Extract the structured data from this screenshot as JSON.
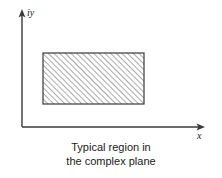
{
  "figure": {
    "background_color": "#ffffff",
    "line_color": "#3a3a3a",
    "hatch_color": "#555555",
    "width": 222,
    "height": 178
  },
  "axes": {
    "y_axis": {
      "label": "iy",
      "name": "imaginary-axis",
      "x": 22,
      "y_top": 12,
      "y_bottom": 127,
      "arrow": "up"
    },
    "x_axis": {
      "label": "x",
      "name": "real-axis",
      "y": 127,
      "x_left": 22,
      "x_right": 203,
      "arrow": "right"
    }
  },
  "region": {
    "name": "hatched-rectangle",
    "shape": "rectangle",
    "hatch_pattern": "diagonal-45-up",
    "hatch_spacing_px": 4,
    "left": 43,
    "top": 53,
    "right": 144,
    "bottom": 104,
    "fill": "none",
    "stroke": "#3a3a3a"
  },
  "caption": {
    "line1": "Typical region in",
    "line2": "the complex plane"
  }
}
